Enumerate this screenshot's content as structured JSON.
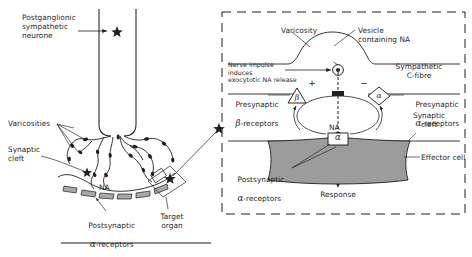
{
  "figure": {
    "background": "#ffffff",
    "ink": "#1f1f1f",
    "effector_fill": "#9a9a9a",
    "receptor_fill": "#a8a8a8"
  },
  "left_panel": {
    "labels": {
      "neurone": "Postganglionic\nsympathetic\nneurone",
      "varicosities": "Varicosities",
      "synaptic_cleft": "Synaptic\ncleft",
      "na": "NA",
      "postsynaptic_receptors_line1": "Postsynaptic",
      "postsynaptic_receptors_line2_greek": "α",
      "postsynaptic_receptors_line2_rest": "-receptors",
      "target_organ": "Target\norgan"
    }
  },
  "right_panel": {
    "labels": {
      "varicosity": "Varicosity",
      "vesicle": "Vesicle\ncontaining NA",
      "nerve_impulse": "Nerve impulse\ninduces\nexocytotic NA release",
      "sympathetic_c_fibre": "Sympathetic\nC-fibre",
      "presynaptic_beta_line1": "Presynaptic",
      "presynaptic_beta_greek": "β",
      "presynaptic_beta_rest": "-receptors",
      "presynaptic_alpha_line1": "Presynaptic",
      "presynaptic_alpha_greek": "α",
      "presynaptic_alpha_rest": "-receptors",
      "synaptic_cleft": "Synaptic\ncleft",
      "na": "NA",
      "effector_cell": "Effector cell",
      "postsynaptic_line1": "Postsynaptic",
      "postsynaptic_greek": "α",
      "postsynaptic_rest": "-receptors",
      "response": "Response",
      "beta_receptor_symbol": "β",
      "alpha_presyn_symbol": "α",
      "alpha_postsyn_symbol": "α",
      "sign_positive": "+",
      "sign_negative": "−"
    }
  }
}
